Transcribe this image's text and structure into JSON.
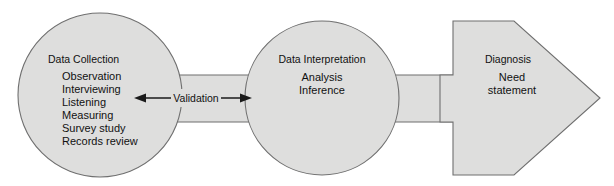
{
  "diagram": {
    "colors": {
      "shape_fill": "#dededd",
      "shape_stroke": "#6f6f6f",
      "text": "#111111",
      "arrow": "#1a1a1a",
      "background": "#ffffff"
    },
    "stages": [
      {
        "id": "data-collection",
        "shape": "circle",
        "heading": "Data Collection",
        "items": [
          "Observation",
          "Interviewing",
          "Listening",
          "Measuring",
          "Survey study",
          "Records review"
        ]
      },
      {
        "id": "data-interpretation",
        "shape": "circle",
        "heading": "Data Interpretation",
        "items": [
          "Analysis",
          "Inference"
        ]
      },
      {
        "id": "diagnosis",
        "shape": "arrow",
        "heading": "Diagnosis",
        "items": [
          "Need",
          "statement"
        ]
      }
    ],
    "connector": {
      "id": "validation",
      "label": "Validation",
      "arrow_type": "double-headed"
    }
  }
}
